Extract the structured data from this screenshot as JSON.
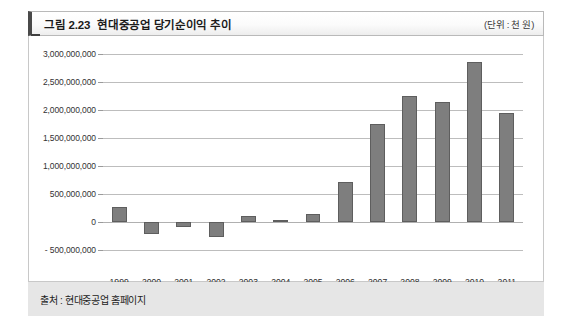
{
  "figure": {
    "number": "그림 2.23",
    "title": "현대중공업 당기순이익 추이",
    "unit": "(단위 : 천 원)",
    "source": "출처 : 현대중공업 홈페이지"
  },
  "colors": {
    "bar_fill": "#7e7e7e",
    "bar_stroke": "#5e5e5e",
    "gridline": "#bdbdbd",
    "header_accent": "#4a4a4a",
    "footer_background": "#e6e6e6"
  },
  "chart_data": {
    "type": "bar",
    "title": "현대중공업 당기순이익 추이",
    "xlabel": "",
    "ylabel": "",
    "unit": "천 원",
    "categories": [
      "1999",
      "2000",
      "2001",
      "2002",
      "2003",
      "2004",
      "2005",
      "2006",
      "2007",
      "2008",
      "2009",
      "2010",
      "2011"
    ],
    "values": [
      260000000,
      -220000000,
      -90000000,
      -270000000,
      100000000,
      40000000,
      150000000,
      720000000,
      1750000000,
      2250000000,
      2150000000,
      2850000000,
      1950000000
    ],
    "ylim": [
      -500000000,
      3000000000
    ],
    "ytick_values": [
      3000000000,
      2500000000,
      2000000000,
      1500000000,
      1000000000,
      500000000,
      0,
      -500000000
    ],
    "ytick_labels": [
      "3,000,000,000",
      "2,500,000,000",
      "2,000,000,000",
      "1,500,000,000",
      "1,000,000,000",
      "500,000,000",
      "0",
      "- 500,000,000"
    ],
    "grid": true,
    "legend": false
  }
}
